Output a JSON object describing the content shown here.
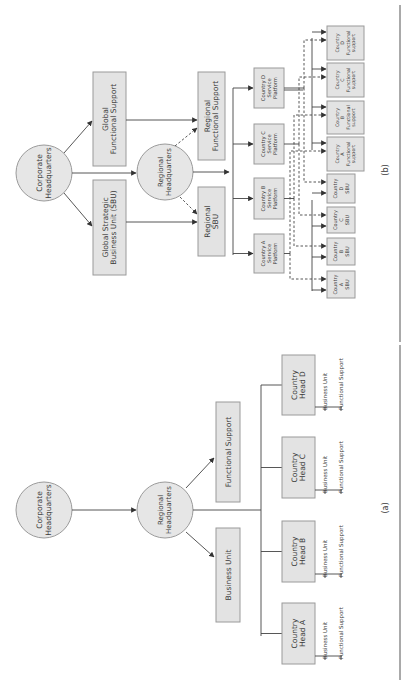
{
  "figure_b": {
    "caption": "(b)",
    "corporate_hq": [
      "Corporate",
      "Headquarters"
    ],
    "global_sbu": [
      "Global Strategic",
      "Business Unit (SBU)"
    ],
    "global_functional_support": [
      "Global",
      "Functional Support"
    ],
    "regional_hq": [
      "Regional",
      "Headquarters"
    ],
    "regional_sbu": [
      "Regional",
      "SBU"
    ],
    "regional_functional_support": [
      "Regional",
      "Functional Support"
    ],
    "service_platforms": [
      [
        "Country A",
        "Service",
        "Platform"
      ],
      [
        "Country B",
        "Service",
        "Platform"
      ],
      [
        "Country C",
        "Service",
        "Platform"
      ],
      [
        "Country D",
        "Service",
        "Platform"
      ]
    ],
    "country_sbus": [
      [
        "Country",
        "A",
        "SBU"
      ],
      [
        "Country",
        "B",
        "SBU"
      ],
      [
        "Country",
        "C",
        "SBU"
      ],
      [
        "Country",
        "D",
        "SBU"
      ]
    ],
    "country_functional_supports": [
      [
        "Country",
        "A",
        "Functional",
        "support"
      ],
      [
        "Country",
        "B",
        "Functional",
        "support"
      ],
      [
        "Country",
        "C",
        "Functional",
        "support"
      ],
      [
        "Country",
        "D",
        "Functional",
        "support"
      ]
    ]
  },
  "figure_a": {
    "caption": "(a)",
    "corporate_hq": [
      "Corporate",
      "Headquarters"
    ],
    "regional_hq": [
      "Regional",
      "Headquarters"
    ],
    "business_unit": [
      "Business Unit"
    ],
    "functional_support": [
      "Functional Support"
    ],
    "country_heads": [
      {
        "label": [
          "Country",
          "Head A"
        ],
        "sub": [
          "Business Unit",
          "Functional Support"
        ]
      },
      {
        "label": [
          "Country",
          "Head B"
        ],
        "sub": [
          "Business Unit",
          "Functional Support"
        ]
      },
      {
        "label": [
          "Country",
          "Head C"
        ],
        "sub": [
          "Business Unit",
          "Functional Support"
        ]
      },
      {
        "label": [
          "Country",
          "Head D"
        ],
        "sub": [
          "Business Unit",
          "Functional Support"
        ]
      }
    ]
  },
  "colors": {
    "box_fill": "#e3e3e3",
    "box_stroke": "#9a9a9a",
    "line": "#444444",
    "text": "#3a3a3a"
  }
}
